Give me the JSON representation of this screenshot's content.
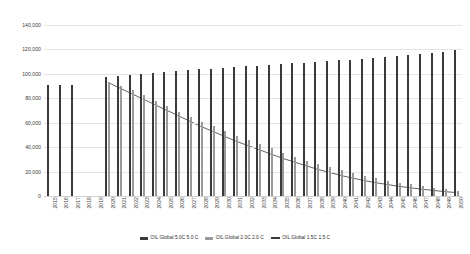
{
  "chart_data": {
    "type": "bar",
    "title": "",
    "xlabel": "",
    "ylabel": "",
    "ylim": [
      0,
      140000
    ],
    "ytick_values": [
      0,
      20000,
      40000,
      60000,
      80000,
      100000,
      120000,
      140000
    ],
    "ytick_labels": [
      "0",
      "20,000",
      "40,000",
      "60,000",
      "80,000",
      "100,000",
      "120,000",
      "140,000"
    ],
    "grid": true,
    "legend_position": "bottom",
    "categories": [
      "2015",
      "2016",
      "2017",
      "2018",
      "2019",
      "2020",
      "2021",
      "2022",
      "2023",
      "2024",
      "2025",
      "2026",
      "2027",
      "2028",
      "2029",
      "2030",
      "2031",
      "2032",
      "2033",
      "2034",
      "2035",
      "2036",
      "2037",
      "2038",
      "2039",
      "2040",
      "2041",
      "2042",
      "2043",
      "2044",
      "2045",
      "2046",
      "2047",
      "2048",
      "2049",
      "2050"
    ],
    "series": [
      {
        "name": "OIL Global 5.0C 5.0 C",
        "type": "bar",
        "color": "#3a3a3a",
        "values": [
          90500,
          90800,
          91200,
          null,
          null,
          97500,
          98200,
          99000,
          99800,
          100600,
          101400,
          102100,
          102900,
          103600,
          104300,
          105000,
          105600,
          106200,
          106800,
          107400,
          108000,
          108600,
          109200,
          109800,
          110400,
          111000,
          111700,
          112400,
          113100,
          113800,
          114600,
          115400,
          116300,
          117200,
          118200,
          119800
        ]
      },
      {
        "name": "OIL Global 2.0C 2.0 C",
        "type": "bar",
        "color": "#9a9a9a",
        "values": [
          null,
          null,
          null,
          null,
          null,
          93000,
          90000,
          86500,
          82500,
          78000,
          73500,
          69000,
          65000,
          61000,
          57000,
          53000,
          49500,
          46000,
          42500,
          39000,
          35500,
          32000,
          29000,
          26000,
          23500,
          21000,
          18500,
          16500,
          14500,
          12500,
          11000,
          9500,
          8000,
          6800,
          5500,
          4200
        ]
      },
      {
        "name": "OIL Global 1.5C 1.5 C",
        "type": "line",
        "color": "#3a3a3a",
        "values": [
          null,
          null,
          null,
          null,
          null,
          93000,
          88500,
          84000,
          79500,
          75000,
          70500,
          66000,
          61500,
          57000,
          53000,
          49000,
          45000,
          41500,
          38000,
          34500,
          31000,
          28000,
          25000,
          22000,
          19500,
          17000,
          14800,
          12800,
          11000,
          9500,
          8000,
          6800,
          5600,
          4600,
          3600,
          2800
        ]
      }
    ],
    "legend": [
      {
        "label": "OIL Global 5.0C 5.0 C",
        "marker": "bar",
        "color": "#3a3a3a"
      },
      {
        "label": "OIL Global 2.0C 2.0 C",
        "marker": "bar",
        "color": "#9a9a9a"
      },
      {
        "label": "OIL Global 1.5C 1.5 C",
        "marker": "line",
        "color": "#3a3a3a"
      }
    ]
  }
}
